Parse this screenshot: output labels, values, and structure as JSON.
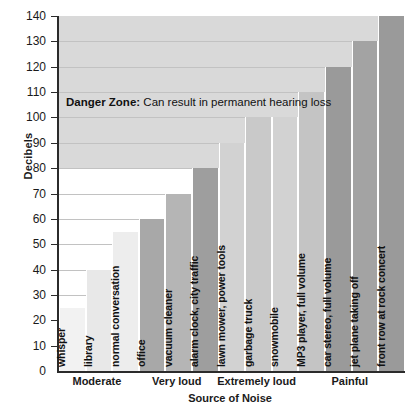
{
  "chart_data": {
    "type": "bar",
    "title": "",
    "xlabel": "Source of Noise",
    "ylabel": "Decibels",
    "ylim": [
      0,
      140
    ],
    "ytick_step": 10,
    "grid": true,
    "categories": [
      "whisper",
      "library",
      "normal conversation",
      "office",
      "vacuum cleaner",
      "alarm clock, city traffic",
      "lawn mower, power tools",
      "garbage truck",
      "snowmobile",
      "MP3 player, full volume",
      "car stereo, full volume",
      "jet plane taking off",
      "front row at rock concert"
    ],
    "values": [
      25,
      40,
      55,
      60,
      70,
      80,
      90,
      100,
      100,
      110,
      120,
      130,
      140
    ],
    "bar_shades": [
      "#f2f2f2",
      "#e8e8e8",
      "#ededed",
      "#a8a8a8",
      "#b5b5b5",
      "#9e9e9e",
      "#d2d2d2",
      "#c9c9c9",
      "#d2d2d2",
      "#c4c4c4",
      "#9a9a9a",
      "#a3a3a3",
      "#9a9a9a"
    ],
    "yticks": [
      0,
      10,
      20,
      30,
      40,
      50,
      60,
      70,
      80,
      90,
      100,
      110,
      120,
      130,
      140
    ],
    "groups": [
      {
        "label": "Moderate",
        "span": 3
      },
      {
        "label": "Very loud",
        "span": 3
      },
      {
        "label": "Extremely loud",
        "span": 3
      },
      {
        "label": "Painful",
        "span": 4
      }
    ],
    "annotations": [
      {
        "name": "danger-zone",
        "bold_text": "Danger Zone:",
        "text": " Can result in permanent hearing loss",
        "band_from": 80,
        "band_to": 140,
        "band_color": "#d9d9d9"
      }
    ]
  },
  "colors": {
    "axis": "#2b2b2b",
    "grid": "#c2c2c2",
    "text": "#1a1a1a",
    "danger_band": "#d9d9d9"
  }
}
